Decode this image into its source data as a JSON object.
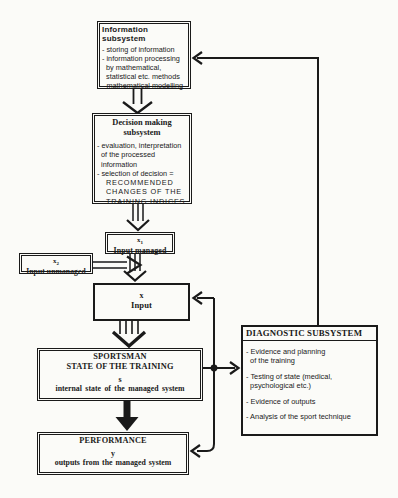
{
  "colors": {
    "background": "#fbfbf8",
    "ink": "#1a1a1a"
  },
  "diagram": {
    "information": {
      "title": "Information subsystem",
      "items": [
        "- storing of information",
        "- information processing\n  by mathematical,\n  statistical etc. methods",
        "- mathematical modelling"
      ]
    },
    "decision": {
      "title": "Decision making\nsubsystem",
      "item1": "- evaluation, interpretation\n  of the processed\n  information",
      "item2": "- selection of decision =",
      "item2_caps": "RECOMMENDED\nCHANGES OF THE\nTRAINING INDICES"
    },
    "input_managed": {
      "var_base": "x",
      "var_sub": "1",
      "label": "Input managed"
    },
    "input_unmanaged": {
      "var_base": "x",
      "var_sub": "2",
      "label": "Input unmanaged"
    },
    "input": {
      "var_base": "x",
      "label": "Input"
    },
    "sportsman": {
      "title": "SPORTSMAN\nSTATE OF THE TRAINING",
      "var": "s",
      "caption": "internal state of the managed system"
    },
    "performance": {
      "title": "PERFORMANCE",
      "var": "y",
      "caption": "outputs from the managed system"
    },
    "diagnostic": {
      "title": "DIAGNOSTIC SUBSYSTEM",
      "items": [
        "- Evidence and planning\n  of the training",
        "- Testing of state (medical,\n  psychological etc.)",
        "- Evidence of outputs",
        "- Analysis of the sport technique"
      ]
    }
  }
}
